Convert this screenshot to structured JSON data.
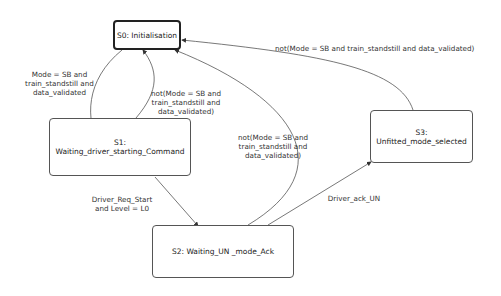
{
  "diagram": {
    "type": "state-machine",
    "states": [
      {
        "id": "S0",
        "label": "S0: Initialisation",
        "initial": true
      },
      {
        "id": "S1",
        "label": "S1: Waiting_driver_starting_Command"
      },
      {
        "id": "S2",
        "label": "S2: Waiting_UN _mode_Ack"
      },
      {
        "id": "S3",
        "label": "S3: Unfitted_mode_selected"
      }
    ],
    "transitions": [
      {
        "from": "S0",
        "to": "S1",
        "lines": [
          "Mode = SB and",
          "train_standstill and",
          "data_validated"
        ]
      },
      {
        "from": "S1",
        "to": "S0",
        "lines": [
          "not(Mode = SB and",
          "train_standstill and",
          "data_validated)"
        ]
      },
      {
        "from": "S1",
        "to": "S2",
        "lines": [
          "Driver_Req_Start",
          "and Level = L0"
        ]
      },
      {
        "from": "S2",
        "to": "S0",
        "lines": [
          "not(Mode = SB and",
          "train_standstill and",
          "data_validated)"
        ]
      },
      {
        "from": "S2",
        "to": "S3",
        "lines": [
          "Driver_ack_UN"
        ]
      },
      {
        "from": "S3",
        "to": "S0",
        "lines": [
          "not(Mode = SB and train_standstill and data_validated)"
        ]
      }
    ]
  }
}
